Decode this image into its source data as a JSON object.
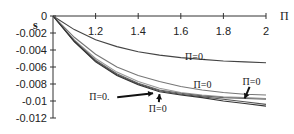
{
  "chart_data": {
    "type": "line",
    "title": "",
    "xlabel": "Π",
    "ylabel": "s",
    "xlim": [
      1,
      2
    ],
    "ylim": [
      -0.012,
      0
    ],
    "xticks": [
      "1.2",
      "1.4",
      "1.6",
      "1.8",
      "2"
    ],
    "xtick_values": [
      1.2,
      1.4,
      1.6,
      1.8,
      2
    ],
    "yticks": [
      "0",
      "-0.002",
      "-0.004",
      "-0.006",
      "-0.008",
      "-0.01",
      "-0.012"
    ],
    "ytick_values": [
      0,
      -0.002,
      -0.004,
      -0.006,
      -0.008,
      -0.01,
      -0.012
    ],
    "grid": false,
    "x": [
      1.0,
      1.1,
      1.2,
      1.3,
      1.4,
      1.5,
      1.6,
      1.7,
      1.8,
      1.9,
      2.0
    ],
    "series": [
      {
        "name": "curve-1",
        "color": "#444444",
        "values": [
          0,
          -0.0016,
          -0.0028,
          -0.0036,
          -0.0042,
          -0.0046,
          -0.0049,
          -0.0051,
          -0.0053,
          -0.0054,
          -0.0055
        ]
      },
      {
        "name": "curve-2",
        "color": "#777777",
        "values": [
          0,
          -0.0025,
          -0.0045,
          -0.006,
          -0.007,
          -0.0077,
          -0.0083,
          -0.0087,
          -0.009,
          -0.0092,
          -0.0093
        ]
      },
      {
        "name": "curve-3",
        "color": "#999999",
        "values": [
          0,
          -0.0028,
          -0.005,
          -0.0066,
          -0.0077,
          -0.0085,
          -0.009,
          -0.0093,
          -0.0095,
          -0.0096,
          -0.0097
        ]
      },
      {
        "name": "curve-4",
        "color": "#666666",
        "values": [
          0,
          -0.0029,
          -0.0052,
          -0.0068,
          -0.0079,
          -0.0087,
          -0.0091,
          -0.0094,
          -0.0096,
          -0.0097,
          -0.0098
        ]
      },
      {
        "name": "curve-5",
        "color": "#555555",
        "values": [
          0,
          -0.003,
          -0.0053,
          -0.0069,
          -0.008,
          -0.0088,
          -0.0092,
          -0.0095,
          -0.0098,
          -0.0101,
          -0.0104
        ]
      },
      {
        "name": "curve-6",
        "color": "#333333",
        "values": [
          0,
          -0.003,
          -0.0054,
          -0.007,
          -0.0081,
          -0.0089,
          -0.0093,
          -0.0096,
          -0.01,
          -0.0103,
          -0.0106
        ]
      }
    ],
    "annotations": [
      {
        "text": "Π=0.",
        "x": 1.62,
        "y": -0.0052,
        "arrow": false
      },
      {
        "text": "Π=0",
        "x": 1.66,
        "y": -0.0085,
        "arrow": false
      },
      {
        "text": "Π=0",
        "x": 1.89,
        "y": -0.0081,
        "arrow": true,
        "arrow_to": [
          1.9,
          -0.0097
        ]
      },
      {
        "text": "Π=0.",
        "x": 1.17,
        "y": -0.0099,
        "arrow": true,
        "arrow_to": [
          1.47,
          -0.0091
        ]
      },
      {
        "text": "Π=0",
        "x": 1.45,
        "y": -0.0113,
        "arrow": true,
        "arrow_to": [
          1.5,
          -0.0092
        ]
      }
    ]
  }
}
